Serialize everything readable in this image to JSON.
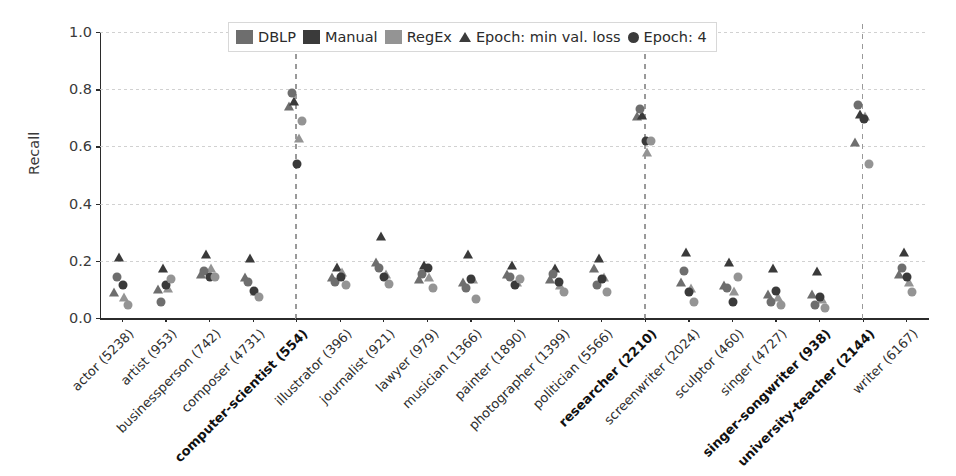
{
  "chart_data": {
    "type": "scatter",
    "title": "",
    "xlabel": "",
    "ylabel": "Recall",
    "ylim": [
      0.0,
      1.0
    ],
    "yticks": [
      "0.0",
      "0.2",
      "0.4",
      "0.6",
      "0.8",
      "1.0"
    ],
    "ytick_values": [
      0.0,
      0.2,
      0.4,
      0.6,
      0.8,
      1.0
    ],
    "grid": "horizontal",
    "legend_position": "upper center",
    "legend": {
      "swatches": [
        {
          "label": "DBLP",
          "color": "#6e6e6e",
          "icon": "color-swatch"
        },
        {
          "label": "Manual",
          "color": "#3a3a3a",
          "icon": "color-swatch"
        },
        {
          "label": "RegEx",
          "color": "#949494",
          "icon": "color-swatch"
        }
      ],
      "markers": [
        {
          "label": "Epoch: min val. loss",
          "shape": "triangle",
          "icon": "triangle-marker-icon"
        },
        {
          "label": "Epoch: 4",
          "shape": "circle",
          "icon": "circle-marker-icon"
        }
      ]
    },
    "categories": [
      {
        "label": "actor (5238)",
        "bold": false,
        "vline": false
      },
      {
        "label": "artist (953)",
        "bold": false,
        "vline": false
      },
      {
        "label": "businessperson (742)",
        "bold": false,
        "vline": false
      },
      {
        "label": "composer (4731)",
        "bold": false,
        "vline": false
      },
      {
        "label": "computer-scientist (554)",
        "bold": true,
        "vline": true
      },
      {
        "label": "illustrator (396)",
        "bold": false,
        "vline": false
      },
      {
        "label": "journalist (921)",
        "bold": false,
        "vline": false
      },
      {
        "label": "lawyer (979)",
        "bold": false,
        "vline": false
      },
      {
        "label": "musician (1366)",
        "bold": false,
        "vline": false
      },
      {
        "label": "painter (1890)",
        "bold": false,
        "vline": false
      },
      {
        "label": "photographer (1399)",
        "bold": false,
        "vline": false
      },
      {
        "label": "politician (5566)",
        "bold": false,
        "vline": false
      },
      {
        "label": "researcher (2210)",
        "bold": true,
        "vline": true
      },
      {
        "label": "screenwriter (2024)",
        "bold": false,
        "vline": false
      },
      {
        "label": "sculptor (460)",
        "bold": false,
        "vline": false
      },
      {
        "label": "singer (4727)",
        "bold": false,
        "vline": false
      },
      {
        "label": "singer-songwriter (938)",
        "bold": true,
        "vline": false
      },
      {
        "label": "university-teacher (2144)",
        "bold": true,
        "vline": true
      },
      {
        "label": "writer (6167)",
        "bold": false,
        "vline": false
      }
    ],
    "series": [
      {
        "name": "DBLP / Epoch: min val. loss",
        "source": "DBLP",
        "epoch": "min val. loss",
        "shape": "triangle",
        "color": "#6e6e6e",
        "values": [
          0.09,
          0.1,
          0.155,
          0.145,
          0.74,
          0.145,
          0.195,
          0.135,
          0.125,
          0.155,
          0.135,
          0.175,
          0.705,
          0.125,
          0.115,
          0.085,
          0.085,
          0.615,
          0.155
        ]
      },
      {
        "name": "Manual / Epoch: min val. loss",
        "source": "Manual",
        "epoch": "min val. loss",
        "shape": "triangle",
        "color": "#3a3a3a",
        "values": [
          0.215,
          0.175,
          0.225,
          0.21,
          0.76,
          0.18,
          0.285,
          0.185,
          0.225,
          0.185,
          0.175,
          0.21,
          0.71,
          0.23,
          0.195,
          0.175,
          0.165,
          0.715,
          0.23
        ]
      },
      {
        "name": "RegEx / Epoch: min val. loss",
        "source": "RegEx",
        "epoch": "min val. loss",
        "shape": "triangle",
        "color": "#949494",
        "values": [
          0.075,
          0.105,
          0.175,
          0.095,
          0.63,
          0.16,
          0.155,
          0.145,
          0.135,
          0.125,
          0.115,
          0.145,
          0.58,
          0.105,
          0.095,
          0.075,
          0.065,
          0.705,
          0.125
        ]
      },
      {
        "name": "DBLP / Epoch: 4",
        "source": "DBLP",
        "epoch": "4",
        "shape": "circle",
        "color": "#6e6e6e",
        "values": [
          0.145,
          0.055,
          0.165,
          0.125,
          0.785,
          0.125,
          0.175,
          0.155,
          0.105,
          0.145,
          0.155,
          0.115,
          0.73,
          0.165,
          0.105,
          0.055,
          0.045,
          0.745,
          0.175
        ]
      },
      {
        "name": "Manual / Epoch: 4",
        "source": "Manual",
        "epoch": "4",
        "shape": "circle",
        "color": "#3a3a3a",
        "values": [
          0.115,
          0.115,
          0.145,
          0.095,
          0.54,
          0.145,
          0.145,
          0.175,
          0.135,
          0.115,
          0.125,
          0.135,
          0.62,
          0.09,
          0.055,
          0.095,
          0.075,
          0.695,
          0.145
        ]
      },
      {
        "name": "RegEx / Epoch: 4",
        "source": "RegEx",
        "epoch": "4",
        "shape": "circle",
        "color": "#949494",
        "values": [
          0.045,
          0.135,
          0.145,
          0.075,
          0.69,
          0.115,
          0.12,
          0.105,
          0.065,
          0.135,
          0.09,
          0.09,
          0.62,
          0.055,
          0.145,
          0.045,
          0.035,
          0.54,
          0.09
        ]
      }
    ]
  }
}
